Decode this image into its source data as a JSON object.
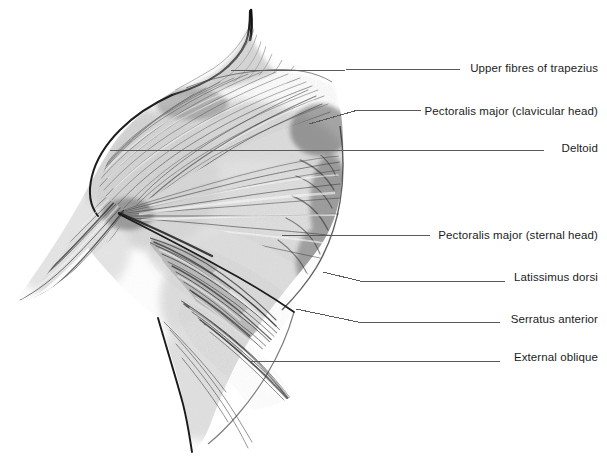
{
  "figure": {
    "background_color": "#ffffff",
    "ink_color": "#1c1c1c",
    "leader_line_color": "#5a5a5a",
    "width": 607,
    "height": 457,
    "medium": "graphite pencil drawing"
  },
  "labels": [
    {
      "id": "trapezius",
      "text": "Upper fibres of trapezius",
      "text_right": 598,
      "text_baseline_y": 72,
      "leader": "M 231 71 L 462 69",
      "anchor_on_body": "superior ridge of neck-to-shoulder slope"
    },
    {
      "id": "pec-major-clavicular",
      "text": "Pectoralis major (clavicular head)",
      "text_right": 598,
      "text_baseline_y": 115,
      "leader": "M 309 124 L 358 110 L 421 110",
      "anchor_on_body": "upper chest fibres below clavicle"
    },
    {
      "id": "deltoid",
      "text": "Deltoid",
      "text_right": 598,
      "text_baseline_y": 152,
      "leader": "M 110 150 L 544 150",
      "anchor_on_body": "shoulder cap"
    },
    {
      "id": "pec-major-sternal",
      "text": "Pectoralis major (sternal head)",
      "text_right": 598,
      "text_baseline_y": 239,
      "leader": "M 282 235 L 430 235",
      "anchor_on_body": "mid chest mass"
    },
    {
      "id": "latissimus-dorsi",
      "text": "Latissimus dorsi",
      "text_right": 598,
      "text_baseline_y": 281,
      "leader": "M 323 272 L 360 281 L 505 281",
      "anchor_on_body": "lateral trunk behind ribs"
    },
    {
      "id": "serratus-anterior",
      "text": "Serratus anterior",
      "text_right": 598,
      "text_baseline_y": 323,
      "leader": "M 296 309 L 358 322 L 500 322",
      "anchor_on_body": "finger-like digitations over ribs"
    },
    {
      "id": "external-oblique",
      "text": "External oblique",
      "text_right": 598,
      "text_baseline_y": 361,
      "leader": "M 250 361 L 500 361",
      "anchor_on_body": "lower lateral abdominal wall"
    }
  ]
}
